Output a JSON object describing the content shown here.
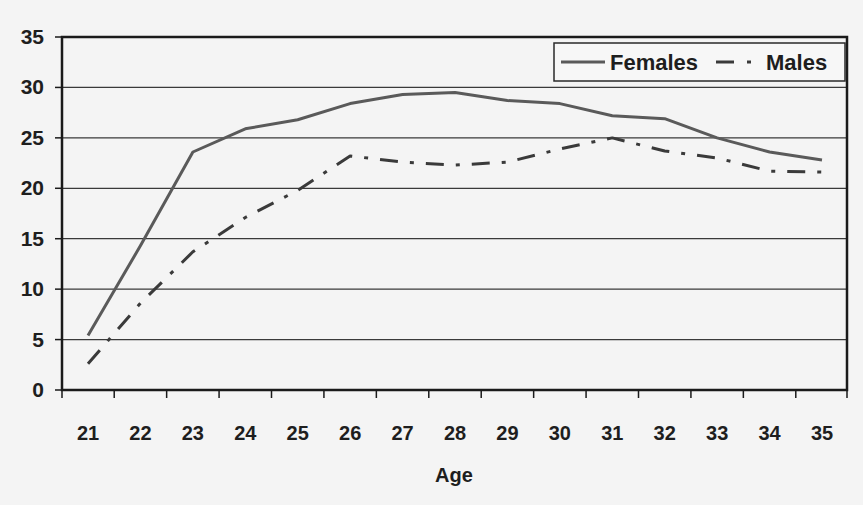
{
  "chart_data": {
    "type": "line",
    "title": "",
    "xlabel": "Age",
    "ylabel": "",
    "x": [
      21,
      22,
      23,
      24,
      25,
      26,
      27,
      28,
      29,
      30,
      31,
      32,
      33,
      34,
      35
    ],
    "x_tick_labels": [
      "21",
      "22",
      "23",
      "24",
      "25",
      "26",
      "27",
      "28",
      "29",
      "30",
      "31",
      "32",
      "33",
      "34",
      "35"
    ],
    "y_ticks": [
      0,
      5,
      10,
      15,
      20,
      25,
      30,
      35
    ],
    "y_tick_labels": [
      "0",
      "5",
      "10",
      "15",
      "20",
      "25",
      "30",
      "35"
    ],
    "ylim": [
      0,
      35
    ],
    "xlim": [
      21,
      35
    ],
    "grid": {
      "horizontal": true,
      "vertical": false
    },
    "legend_position": "top-right",
    "series": [
      {
        "name": "Females",
        "style": "solid",
        "color": "#5a5a5a",
        "values": [
          5.4,
          14.3,
          23.6,
          25.9,
          26.8,
          28.4,
          29.3,
          29.5,
          28.7,
          28.4,
          27.2,
          26.9,
          25.0,
          23.6,
          22.8
        ]
      },
      {
        "name": "Males",
        "style": "dash-dot",
        "color": "#3a3a3a",
        "values": [
          2.6,
          8.6,
          13.7,
          17.1,
          19.8,
          23.2,
          22.6,
          22.3,
          22.6,
          23.9,
          25.0,
          23.7,
          23.0,
          21.7,
          21.6
        ]
      }
    ]
  },
  "legend": {
    "items": [
      {
        "label": "Females"
      },
      {
        "label": "Males"
      }
    ]
  },
  "axes": {
    "x_title": "Age"
  }
}
